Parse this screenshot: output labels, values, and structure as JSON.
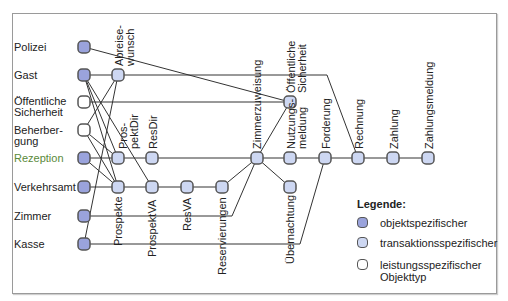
{
  "header": {
    "cut_title": "Typ ... ... ..."
  },
  "colors": {
    "object_fill": "#9aa3dc",
    "transaction_fill": "#cdd7f2",
    "service_fill": "#ffffff",
    "stroke": "#555555",
    "accent_label": "#5a8a3a"
  },
  "rows": [
    {
      "label": "Polizei"
    },
    {
      "label": "Gast"
    },
    {
      "label": "Öffentliche\nSicherheit"
    },
    {
      "label": "Beherber-\ngung"
    },
    {
      "label": "Rezeption"
    },
    {
      "label": "Verkehrsamt"
    },
    {
      "label": "Zimmer"
    },
    {
      "label": "Kasse"
    }
  ],
  "columns": {
    "abreisewunsch": "Abreise-\nwunsch",
    "prospektdir": "Pros-\npektDir",
    "resdir": "ResDir",
    "prospekte": "Prospekte",
    "prospektva": "ProspektVA",
    "resva": "ResVA",
    "reservierungen": "Reservierungen",
    "zimmerzuweisung": "Zimmerzuweisung",
    "oeff_sicherheit": "Öffentliche\nSicherheit",
    "nutzungsmeldung": "Nutzungs-\nmeldung",
    "uebernachtung": "Übernachtung",
    "forderung": "Forderung",
    "rechnung": "Rechnung",
    "zahlung": "Zahlung",
    "zahlungsmeldung": "Zahlungsmeldung"
  },
  "legend": {
    "title": "Legende:",
    "items": [
      {
        "label": "objektspezifischer",
        "type": "object"
      },
      {
        "label": "transaktionsspezifischer",
        "type": "transaction"
      },
      {
        "label": "leistungsspezifischer\nObjekttyp",
        "type": "service"
      }
    ]
  }
}
